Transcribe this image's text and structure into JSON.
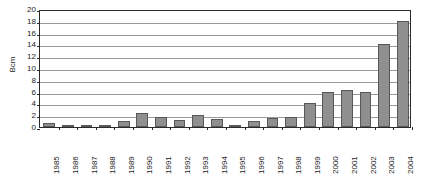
{
  "chart_data": {
    "type": "bar",
    "title": "",
    "xlabel": "",
    "ylabel": "Bcm",
    "ylim": [
      0,
      20
    ],
    "ytick_step": 2,
    "yticks": [
      0,
      2,
      4,
      6,
      8,
      10,
      12,
      14,
      16,
      18,
      20
    ],
    "ytick_labels": [
      "0",
      "2",
      "4",
      "6",
      "8",
      "10",
      "12",
      "14",
      "16",
      "18",
      "20"
    ],
    "grid": true,
    "grid_axis": "y",
    "legend": false,
    "legend_position": "none",
    "bar_color": "#8f8f8f",
    "bar_edge_color": "#585858",
    "axis_color": "#2b2b2b",
    "gridline_color": "#9a9a9a",
    "background_color": "#ffffff",
    "xtick_rotation": -90,
    "categories": [
      "1985",
      "1986",
      "1987",
      "1988",
      "1989",
      "1990",
      "1991",
      "1992",
      "1993",
      "1994",
      "1995",
      "1996",
      "1997",
      "1998",
      "1999",
      "2000",
      "2001",
      "2002",
      "2003",
      "2004"
    ],
    "values": [
      0.6,
      0.2,
      0.05,
      0.4,
      1.0,
      2.3,
      1.7,
      1.2,
      2.1,
      1.3,
      0.4,
      1.0,
      1.6,
      1.7,
      4.0,
      6.0,
      6.2,
      6.0,
      14.0,
      18.0
    ]
  }
}
